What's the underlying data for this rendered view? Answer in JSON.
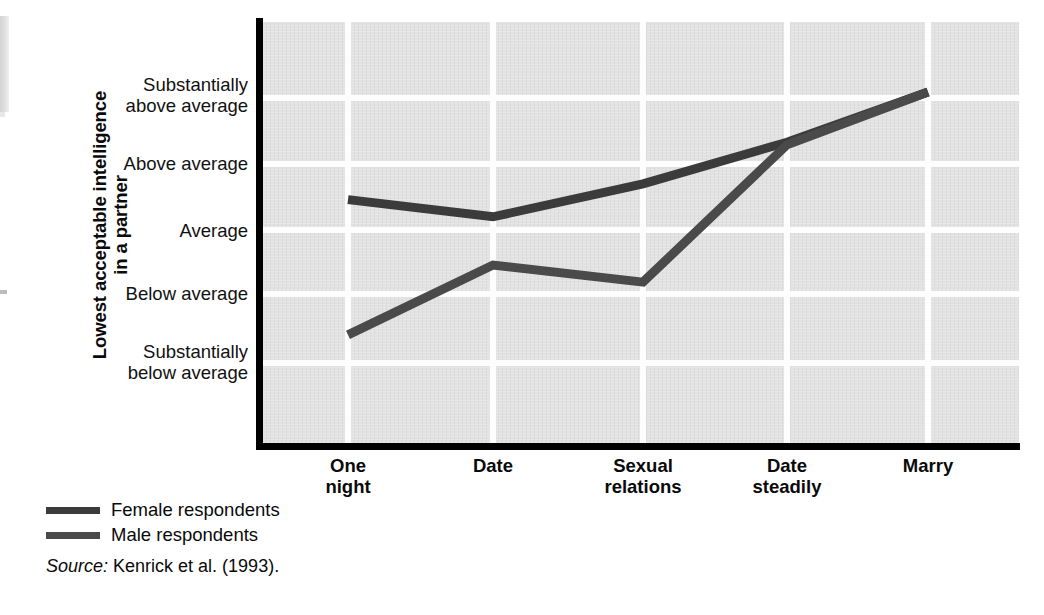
{
  "figure": {
    "y_axis_title": "Lowest acceptable intelligence\nin a partner",
    "source_prefix": "Source:",
    "source_text": "Kenrick et al. (1993).",
    "colors": {
      "plot_background": "#e2e2e2",
      "gridline": "#fdfdfd",
      "axis": "#000000",
      "female_line": "#3b3b3b",
      "male_line": "#4a4a4a",
      "page_background": "#ffffff",
      "text": "#0a0a0a"
    }
  },
  "chart_data": {
    "type": "line",
    "title": "",
    "xlabel": "",
    "ylabel": "Lowest acceptable intelligence in a partner",
    "categories": [
      "One night",
      "Date",
      "Sexual relations",
      "Date steadily",
      "Marry"
    ],
    "category_lines": [
      [
        "One",
        "night"
      ],
      [
        "Date",
        ""
      ],
      [
        "Sexual",
        "relations"
      ],
      [
        "Date",
        "steadily"
      ],
      [
        "Marry",
        ""
      ]
    ],
    "ytick_labels": [
      "Substantially\nabove average",
      "Above average",
      "Average",
      "Below average",
      "Substantially\nbelow average"
    ],
    "ytick_lines": [
      [
        "Substantially",
        "above average"
      ],
      [
        "Above average",
        ""
      ],
      [
        "Average",
        ""
      ],
      [
        "Below average",
        ""
      ],
      [
        "Substantially",
        "below average"
      ]
    ],
    "ylim": [
      -2.5,
      2.5
    ],
    "ytick_values": [
      2,
      1,
      0,
      -1,
      -2
    ],
    "grid": true,
    "legend_position": "below-left",
    "series": [
      {
        "name": "Female respondents",
        "values": [
          0.43,
          0.17,
          0.67,
          1.3,
          2.06
        ]
      },
      {
        "name": "Male respondents",
        "values": [
          -1.62,
          -0.56,
          -0.82,
          1.26,
          2.06
        ]
      }
    ]
  },
  "legend": {
    "items": [
      {
        "label": "Female respondents",
        "color": "#3b3b3b"
      },
      {
        "label": "Male respondents",
        "color": "#4a4a4a"
      }
    ]
  }
}
